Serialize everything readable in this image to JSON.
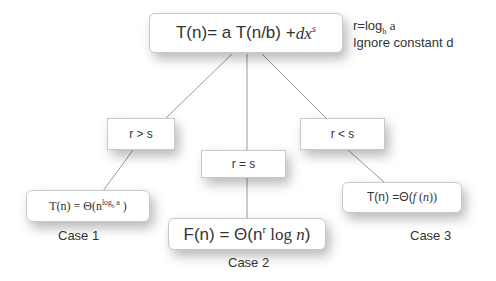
{
  "diagram": {
    "root": {
      "prefix": "T(n)= a T(n/b) + ",
      "term_var": "dx",
      "term_exp": "s"
    },
    "note": {
      "line1_prefix": "r=log",
      "line1_sub": "b",
      "line1_suffix": " a",
      "line2": "Ignore constant d"
    },
    "conditions": [
      {
        "label": "r > s"
      },
      {
        "label": "r = s"
      },
      {
        "label": "r < s"
      }
    ],
    "results": [
      {
        "prefix": "T(n) = Θ(n",
        "sup": "log",
        "sup_sub": "b",
        "sup_tail": " a",
        "suffix": " )",
        "case_label": "Case 1"
      },
      {
        "prefix": "F(n) = Θ(n",
        "sup": "r",
        "suffix_plain": "  log ",
        "suffix_var": "n",
        "suffix_close": ")",
        "case_label": "Case 2"
      },
      {
        "prefix": "T(n) =Θ(",
        "func": "f",
        "open": " (",
        "var": "n",
        "close": "))",
        "case_label": "Case 3"
      }
    ],
    "colors": {
      "line": "#9a9a9a",
      "border": "#c8c8c8",
      "text": "#333333"
    }
  }
}
